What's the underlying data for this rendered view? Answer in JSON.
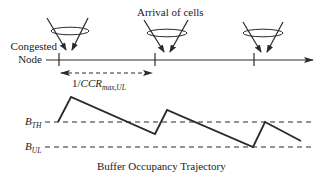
{
  "diagram": {
    "top_label": "Arrival of cells",
    "node_label_line1": "Congested",
    "node_label_line2": "Node",
    "interval_label": {
      "prefix": "1/",
      "main": "CCR",
      "sub": "max,UL"
    },
    "threshold_labels": {
      "b_th": {
        "main": "B",
        "sub": "TH"
      },
      "b_ul": {
        "main": "B",
        "sub": "UL"
      }
    },
    "caption": "Buffer Occupancy Trajectory",
    "trajectory": {
      "points": "58,122 71,97 155,134 167,110 253,147 265,122 301,141"
    },
    "arrival_count": 3
  }
}
